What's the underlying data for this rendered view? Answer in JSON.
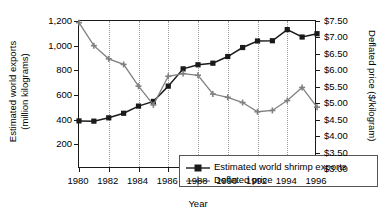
{
  "chart_data": {
    "type": "line",
    "title": "",
    "xlabel": "Year",
    "ylabel": "Estimated world exports (million kilograms)",
    "ylabel_right": "Deflated price ($/kilogram)",
    "x": [
      1980,
      1981,
      1982,
      1983,
      1984,
      1985,
      1986,
      1987,
      1988,
      1989,
      1990,
      1991,
      1992,
      1993,
      1994,
      1995,
      1996
    ],
    "xlim": [
      1980,
      1996
    ],
    "xticks": [
      1980,
      1982,
      1984,
      1986,
      1988,
      1990,
      1992,
      1994,
      1996
    ],
    "xticklabels": [
      "1980",
      "1982",
      "1984",
      "1986",
      "1988",
      "1990",
      "1992",
      "1994",
      "1996"
    ],
    "ylim": [
      0,
      1200
    ],
    "yticks": [
      200,
      400,
      600,
      800,
      1000,
      1200
    ],
    "yticklabels": [
      "200",
      "400",
      "600",
      "800",
      "1,000",
      "1,200"
    ],
    "ylim_right": [
      3.0,
      7.5
    ],
    "yticks_right": [
      3.0,
      3.5,
      4.0,
      4.5,
      5.0,
      5.5,
      6.0,
      6.5,
      7.0,
      7.5
    ],
    "yticklabels_right": [
      "$3.00",
      "$3.50",
      "$4.00",
      "$4.50",
      "$5.00",
      "$5.50",
      "$6.00",
      "$6.50",
      "$7.00",
      "$7.50"
    ],
    "grid": "vertical-dotted",
    "legend_position": "lower-center-inside",
    "series": [
      {
        "name": "Estimated world shrimp exports",
        "axis": "left",
        "color": "#1a1a1a",
        "marker": "square",
        "values": [
          390,
          388,
          415,
          452,
          510,
          548,
          672,
          812,
          845,
          858,
          912,
          985,
          1038,
          1040,
          1130,
          1070,
          1097
        ]
      },
      {
        "name": "Deflated price",
        "axis": "right",
        "color": "#808080",
        "marker": "cross",
        "values": [
          7.45,
          6.75,
          6.35,
          6.18,
          5.52,
          4.95,
          5.82,
          5.9,
          5.85,
          5.28,
          5.18,
          5.02,
          4.74,
          4.78,
          5.08,
          5.48,
          4.88
        ]
      }
    ]
  },
  "legend": {
    "items": [
      {
        "label": "Estimated world shrimp exports"
      },
      {
        "label": "Deflated price"
      }
    ]
  },
  "axis_titles": {
    "left_line1": "Estimated world exports",
    "left_line2": "(million kilograms)",
    "right": "Deflated price ($/kilogram)",
    "bottom": "Year"
  }
}
